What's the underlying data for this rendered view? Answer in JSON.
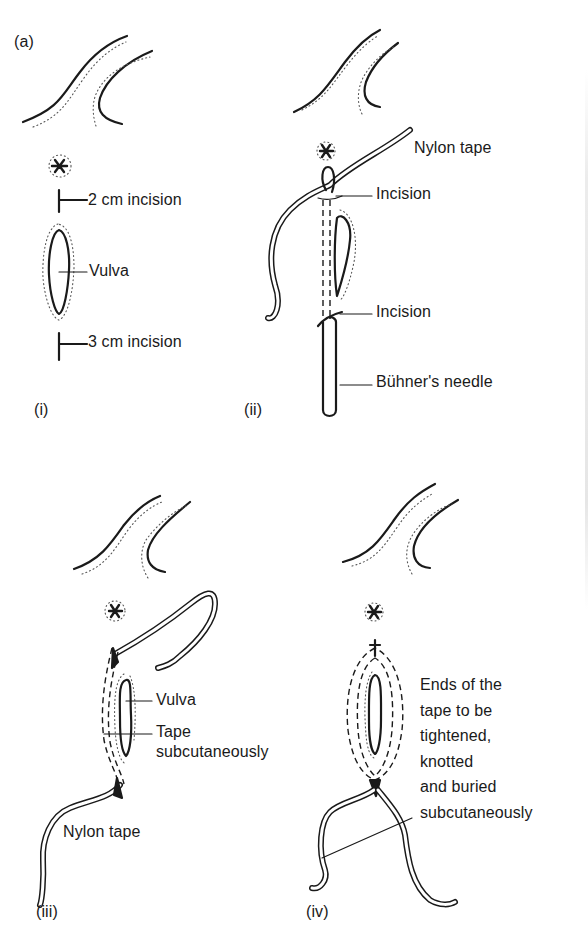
{
  "figure": {
    "label": "(a)",
    "panels": [
      {
        "id": "i",
        "label": "(i)",
        "annotations": [
          "2 cm incision",
          "Vulva",
          "3 cm incision"
        ]
      },
      {
        "id": "ii",
        "label": "(ii)",
        "annotations": [
          "Nylon tape",
          "Incision",
          "Incision",
          "Bühner's needle"
        ]
      },
      {
        "id": "iii",
        "label": "(iii)",
        "annotations": [
          "Vulva",
          "Tape",
          "subcutaneously",
          "Nylon tape"
        ]
      },
      {
        "id": "iv",
        "label": "(iv)",
        "annotations": [
          "Ends of the",
          "tape to be",
          "tightened,",
          "knotted",
          "and buried",
          "subcutaneously"
        ]
      }
    ]
  }
}
